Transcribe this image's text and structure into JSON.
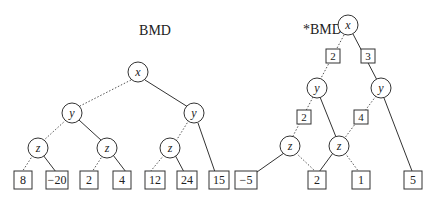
{
  "diagrams": [
    {
      "title": "BMD",
      "nodes": [
        {
          "id": "x",
          "label": "x"
        },
        {
          "id": "y1",
          "label": "y"
        },
        {
          "id": "y2",
          "label": "y"
        },
        {
          "id": "z1",
          "label": "z"
        },
        {
          "id": "z2",
          "label": "z"
        },
        {
          "id": "z3",
          "label": "z"
        }
      ],
      "leaves": [
        "8",
        "−20",
        "2",
        "4",
        "12",
        "24",
        "15"
      ]
    },
    {
      "title": "*BMD",
      "nodes": [
        {
          "id": "x",
          "label": "x"
        },
        {
          "id": "y1",
          "label": "y"
        },
        {
          "id": "y2",
          "label": "y"
        },
        {
          "id": "z1",
          "label": "z"
        },
        {
          "id": "z2",
          "label": "z"
        }
      ],
      "edge_weights": [
        "2",
        "3",
        "2",
        "4"
      ],
      "leaves": [
        "−5",
        "2",
        "1",
        "5"
      ]
    }
  ]
}
